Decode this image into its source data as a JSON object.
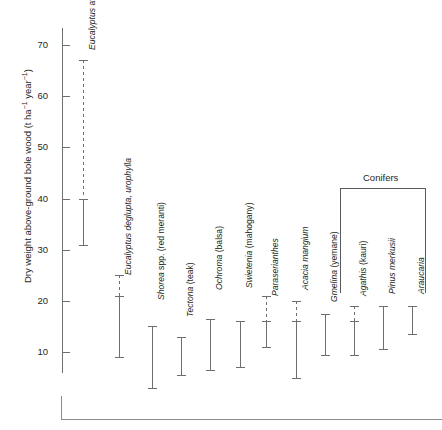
{
  "chart_data": {
    "type": "bar",
    "title": "",
    "xlabel": "",
    "ylabel": "Dry weight above-ground bole wood (t ha⁻¹ year⁻¹)",
    "ylabel_parts": {
      "main": "Dry weight above-ground bole wood (t ha",
      "sup1": "−1",
      "mid": " year",
      "sup2": "−1",
      "end": ")"
    },
    "ylim": [
      0,
      75
    ],
    "yticks": [
      10,
      20,
      30,
      40,
      50,
      60,
      70
    ],
    "ytick_labels": [
      "10",
      "20",
      "30",
      "40",
      "50",
      "60",
      "70"
    ],
    "grid": false,
    "legend": "none",
    "units": "t ha-1 year-1",
    "groups": [
      {
        "name": "Conifers",
        "members": [
          "Agathis (kauri)",
          "Pinus merkusii",
          "Araucaria"
        ]
      }
    ],
    "categories": [
      "Eucalyptus at Ara Cruz",
      "Eucalyptus deglupta, urophylla",
      "Shorea spp. (red meranti)",
      "Tectona (teak)",
      "Ochroma (balsa)",
      "Swietenia (mahogany)",
      "Paraserianthes",
      "Acacia mangium",
      "Gmelina (yemane)",
      "Agathis (kauri)",
      "Pinus merkusii",
      "Araucaria"
    ],
    "series": [
      {
        "name": "Eucalyptus at Ara Cruz",
        "label_italic": "Eucalyptus",
        "label_roman": " at Ara Cruz",
        "solid_low": 31,
        "solid_high": 40,
        "dashed_high": 67,
        "has_dashed": true
      },
      {
        "name": "Eucalyptus deglupta, urophylla",
        "label_italic": "Eucalyptus deglupta, urophylla",
        "label_roman": "",
        "solid_low": 9,
        "solid_high": 21,
        "dashed_high": 25,
        "has_dashed": true
      },
      {
        "name": "Shorea spp. (red meranti)",
        "label_italic": "Shorea",
        "label_roman": " spp. (red meranti)",
        "solid_low": 3,
        "solid_high": 15,
        "dashed_high": null,
        "has_dashed": false
      },
      {
        "name": "Tectona (teak)",
        "label_italic": "Tectona",
        "label_roman": " (teak)",
        "solid_low": 5.5,
        "solid_high": 13,
        "dashed_high": null,
        "has_dashed": false
      },
      {
        "name": "Ochroma (balsa)",
        "label_italic": "Ochroma",
        "label_roman": " (balsa)",
        "solid_low": 6.5,
        "solid_high": 16.5,
        "dashed_high": null,
        "has_dashed": false
      },
      {
        "name": "Swietenia (mahogany)",
        "label_italic": "Swietenia",
        "label_roman": " (mahogany)",
        "solid_low": 7,
        "solid_high": 16,
        "dashed_high": null,
        "has_dashed": false
      },
      {
        "name": "Paraserianthes",
        "label_italic": "Paraserianthes",
        "label_roman": "",
        "solid_low": 11,
        "solid_high": 16,
        "dashed_high": 21,
        "has_dashed": true
      },
      {
        "name": "Acacia mangium",
        "label_italic": "Acacia mangium",
        "label_roman": "",
        "solid_low": 5,
        "solid_high": 16,
        "dashed_high": 20,
        "has_dashed": true
      },
      {
        "name": "Gmelina (yemane)",
        "label_italic": "Gmelina",
        "label_roman": " (yemane)",
        "solid_low": 9.5,
        "solid_high": 17.5,
        "dashed_high": null,
        "has_dashed": false
      },
      {
        "name": "Agathis (kauri)",
        "label_italic": "Agathis",
        "label_roman": " (kauri)",
        "solid_low": 9.5,
        "solid_high": 16,
        "dashed_high": 19,
        "has_dashed": true
      },
      {
        "name": "Pinus merkusii",
        "label_italic": "Pinus merkusii",
        "label_roman": "",
        "solid_low": 10.5,
        "solid_high": 19,
        "dashed_high": null,
        "has_dashed": false
      },
      {
        "name": "Araucaria",
        "label_italic": "Araucaria",
        "label_roman": "",
        "solid_low": 13.5,
        "solid_high": 19,
        "dashed_high": null,
        "has_dashed": false
      }
    ]
  }
}
